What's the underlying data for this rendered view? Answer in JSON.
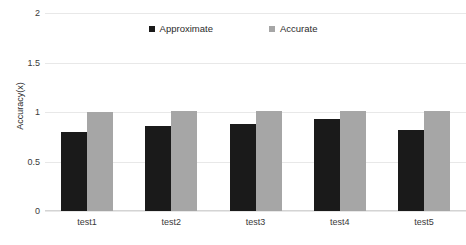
{
  "chart_data": {
    "type": "bar",
    "title": "",
    "xlabel": "",
    "ylabel": "Accuracy(x)",
    "categories": [
      "test1",
      "test2",
      "test3",
      "test4",
      "test5"
    ],
    "series": [
      {
        "name": "Approximate",
        "color": "#1a1a1a",
        "values": [
          0.8,
          0.86,
          0.88,
          0.93,
          0.82
        ]
      },
      {
        "name": "Accurate",
        "color": "#a6a6a6",
        "values": [
          1.0,
          1.01,
          1.01,
          1.01,
          1.01
        ]
      }
    ],
    "ylim": [
      0,
      2
    ],
    "yticks": [
      0,
      0.5,
      1,
      1.5,
      2
    ],
    "ytick_labels": [
      "0",
      "0.5",
      "1",
      "1.5",
      "2"
    ],
    "grid": true,
    "legend_position": "top-center"
  },
  "legend": {
    "items": [
      {
        "label": "Approximate",
        "color": "#1a1a1a"
      },
      {
        "label": "Accurate",
        "color": "#a6a6a6"
      }
    ]
  },
  "axes": {
    "y_title": "Accuracy(x)"
  }
}
